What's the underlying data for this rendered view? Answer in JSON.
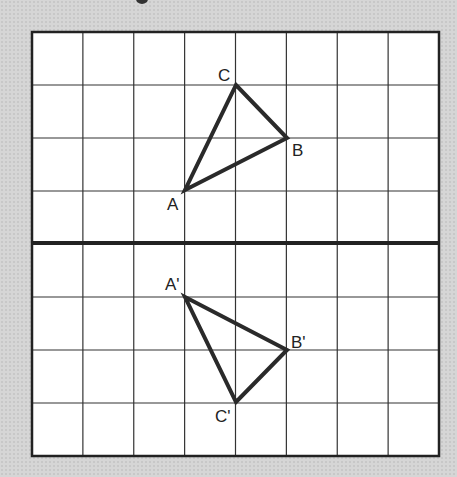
{
  "diagram": {
    "type": "reflection-across-x-axis",
    "grid": {
      "cols": 8,
      "rows": 8,
      "left": 32,
      "top": 32,
      "right": 439,
      "bottom": 456,
      "axis_row": 4,
      "grid_color": "#333333",
      "axis_color": "#222222",
      "fill": "#ffffff"
    },
    "triangles": [
      {
        "name": "original",
        "vertices": [
          {
            "label": "A",
            "col": 3,
            "row": 3
          },
          {
            "label": "B",
            "col": 5,
            "row": 2
          },
          {
            "label": "C",
            "col": 4,
            "row": 1
          }
        ]
      },
      {
        "name": "image",
        "vertices": [
          {
            "label": "A'",
            "col": 3,
            "row": 5
          },
          {
            "label": "B'",
            "col": 5,
            "row": 6
          },
          {
            "label": "C'",
            "col": 4,
            "row": 7
          }
        ]
      }
    ],
    "labels": {
      "A": "A",
      "B": "B",
      "C": "C",
      "A_prime": "A'",
      "B_prime": "B'",
      "C_prime": "C'"
    }
  }
}
